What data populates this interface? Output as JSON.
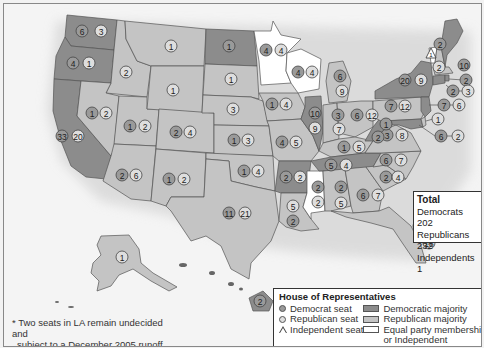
{
  "map": {
    "title": "House of Representatives by State",
    "colors": {
      "democratic_majority": "#8c8c8c",
      "republican_majority": "#c4c4c4",
      "equal_or_independent": "#ffffff",
      "democrat_seat": "#9a9a9a",
      "republican_seat": "#dedede",
      "background": "#f4f4f4"
    },
    "states": [
      {
        "state": "WA",
        "dem": 6,
        "rep": 3,
        "majority": "D"
      },
      {
        "state": "OR",
        "dem": 4,
        "rep": 1,
        "majority": "D"
      },
      {
        "state": "CA",
        "dem": 33,
        "rep": 20,
        "majority": "D"
      },
      {
        "state": "ID",
        "dem": null,
        "rep": 2,
        "majority": "R"
      },
      {
        "state": "NV",
        "dem": 1,
        "rep": 2,
        "majority": "R"
      },
      {
        "state": "UT",
        "dem": 1,
        "rep": 2,
        "majority": "R"
      },
      {
        "state": "AZ",
        "dem": 2,
        "rep": 6,
        "majority": "R"
      },
      {
        "state": "MT",
        "dem": null,
        "rep": 1,
        "majority": "R"
      },
      {
        "state": "WY",
        "dem": null,
        "rep": 1,
        "majority": "R"
      },
      {
        "state": "CO",
        "dem": 2,
        "rep": 4,
        "majority": "R"
      },
      {
        "state": "NM",
        "dem": 1,
        "rep": 2,
        "majority": "R"
      },
      {
        "state": "ND",
        "dem": 1,
        "rep": null,
        "majority": "D"
      },
      {
        "state": "SD",
        "dem": null,
        "rep": 1,
        "majority": "R"
      },
      {
        "state": "NE",
        "dem": null,
        "rep": 3,
        "majority": "R"
      },
      {
        "state": "KS",
        "dem": 1,
        "rep": 3,
        "majority": "R"
      },
      {
        "state": "OK",
        "dem": 1,
        "rep": 4,
        "majority": "R"
      },
      {
        "state": "TX",
        "dem": 11,
        "rep": 21,
        "majority": "R"
      },
      {
        "state": "MN",
        "dem": 4,
        "rep": 4,
        "majority": "E"
      },
      {
        "state": "IA",
        "dem": 1,
        "rep": 4,
        "majority": "R"
      },
      {
        "state": "MO",
        "dem": 4,
        "rep": 5,
        "majority": "R"
      },
      {
        "state": "AR",
        "dem": 2,
        "rep": 2,
        "majority": "D"
      },
      {
        "state": "LA",
        "dem": 2,
        "rep": 5,
        "majority": "R"
      },
      {
        "state": "WI",
        "dem": 4,
        "rep": 4,
        "majority": "E"
      },
      {
        "state": "IL",
        "dem": 10,
        "rep": 9,
        "majority": "D"
      },
      {
        "state": "MS",
        "dem": 2,
        "rep": 2,
        "majority": "E"
      },
      {
        "state": "MI",
        "dem": 6,
        "rep": 9,
        "majority": "R"
      },
      {
        "state": "IN",
        "dem": 3,
        "rep": 7,
        "majority": "R"
      },
      {
        "state": "OH",
        "dem": 6,
        "rep": 12,
        "majority": "R"
      },
      {
        "state": "KY",
        "dem": 1,
        "rep": 5,
        "majority": "R"
      },
      {
        "state": "TN",
        "dem": 5,
        "rep": 4,
        "majority": "D"
      },
      {
        "state": "AL",
        "dem": 2,
        "rep": 5,
        "majority": "R"
      },
      {
        "state": "GA",
        "dem": 6,
        "rep": 7,
        "majority": "R"
      },
      {
        "state": "FL",
        "dem": 7,
        "rep": 18,
        "majority": "R"
      },
      {
        "state": "SC",
        "dem": 2,
        "rep": 4,
        "majority": "R"
      },
      {
        "state": "NC",
        "dem": 6,
        "rep": 7,
        "majority": "R"
      },
      {
        "state": "VA",
        "dem": 3,
        "rep": 8,
        "majority": "R"
      },
      {
        "state": "WV",
        "dem": 2,
        "rep": 1,
        "majority": "D"
      },
      {
        "state": "PA",
        "dem": 7,
        "rep": 12,
        "majority": "R"
      },
      {
        "state": "NY",
        "dem": 20,
        "rep": 9,
        "majority": "D"
      },
      {
        "state": "VT",
        "dem": null,
        "rep": null,
        "ind": 1,
        "majority": "I"
      },
      {
        "state": "NH",
        "dem": null,
        "rep": 2,
        "majority": "R"
      },
      {
        "state": "ME",
        "dem": 2,
        "rep": null,
        "majority": "D"
      },
      {
        "state": "MA",
        "dem": 10,
        "rep": null,
        "majority": "D"
      },
      {
        "state": "RI",
        "dem": 2,
        "rep": null,
        "majority": "D"
      },
      {
        "state": "CT",
        "dem": 2,
        "rep": 3,
        "majority": "R"
      },
      {
        "state": "NJ",
        "dem": 7,
        "rep": 6,
        "majority": "D"
      },
      {
        "state": "DE",
        "dem": null,
        "rep": 1,
        "majority": "R"
      },
      {
        "state": "MD",
        "dem": 6,
        "rep": 2,
        "majority": "D"
      },
      {
        "state": "AK",
        "dem": null,
        "rep": 1,
        "majority": "R"
      },
      {
        "state": "HI",
        "dem": 2,
        "rep": null,
        "majority": "D"
      }
    ],
    "seat_labels": [
      {
        "x": 81,
        "y": 30,
        "v": "6",
        "p": "D"
      },
      {
        "x": 100,
        "y": 30,
        "v": "3",
        "p": "R"
      },
      {
        "x": 72,
        "y": 62,
        "v": "4",
        "p": "D"
      },
      {
        "x": 88,
        "y": 62,
        "v": "1",
        "p": "R"
      },
      {
        "x": 125,
        "y": 71,
        "v": "2",
        "p": "R"
      },
      {
        "x": 61,
        "y": 135,
        "v": "33",
        "p": "D"
      },
      {
        "x": 77,
        "y": 135,
        "v": "20",
        "p": "R"
      },
      {
        "x": 91,
        "y": 112,
        "v": "1",
        "p": "D"
      },
      {
        "x": 105,
        "y": 112,
        "v": "2",
        "p": "R"
      },
      {
        "x": 129,
        "y": 125,
        "v": "1",
        "p": "D"
      },
      {
        "x": 144,
        "y": 125,
        "v": "2",
        "p": "R"
      },
      {
        "x": 121,
        "y": 174,
        "v": "2",
        "p": "D"
      },
      {
        "x": 135,
        "y": 174,
        "v": "6",
        "p": "R"
      },
      {
        "x": 170,
        "y": 45,
        "v": "1",
        "p": "R"
      },
      {
        "x": 172,
        "y": 89,
        "v": "1",
        "p": "R"
      },
      {
        "x": 175,
        "y": 131,
        "v": "2",
        "p": "D"
      },
      {
        "x": 189,
        "y": 131,
        "v": "4",
        "p": "R"
      },
      {
        "x": 168,
        "y": 178,
        "v": "1",
        "p": "D"
      },
      {
        "x": 183,
        "y": 178,
        "v": "2",
        "p": "R"
      },
      {
        "x": 228,
        "y": 45,
        "v": "1",
        "p": "D"
      },
      {
        "x": 230,
        "y": 78,
        "v": "1",
        "p": "R"
      },
      {
        "x": 232,
        "y": 108,
        "v": "3",
        "p": "R"
      },
      {
        "x": 233,
        "y": 139,
        "v": "1",
        "p": "D"
      },
      {
        "x": 247,
        "y": 139,
        "v": "3",
        "p": "R"
      },
      {
        "x": 243,
        "y": 170,
        "v": "1",
        "p": "D"
      },
      {
        "x": 257,
        "y": 170,
        "v": "4",
        "p": "R"
      },
      {
        "x": 228,
        "y": 212,
        "v": "11",
        "p": "D"
      },
      {
        "x": 244,
        "y": 212,
        "v": "21",
        "p": "R"
      },
      {
        "x": 265,
        "y": 49,
        "v": "4",
        "p": "D"
      },
      {
        "x": 280,
        "y": 49,
        "v": "4",
        "p": "R"
      },
      {
        "x": 271,
        "y": 103,
        "v": "1",
        "p": "D"
      },
      {
        "x": 285,
        "y": 103,
        "v": "4",
        "p": "R"
      },
      {
        "x": 281,
        "y": 141,
        "v": "4",
        "p": "D"
      },
      {
        "x": 295,
        "y": 141,
        "v": "5",
        "p": "R"
      },
      {
        "x": 285,
        "y": 176,
        "v": "2",
        "p": "D"
      },
      {
        "x": 299,
        "y": 176,
        "v": "2",
        "p": "R"
      },
      {
        "x": 292,
        "y": 205,
        "v": "5",
        "p": "R"
      },
      {
        "x": 292,
        "y": 220,
        "v": "2",
        "p": "D"
      },
      {
        "x": 297,
        "y": 71,
        "v": "4",
        "p": "D"
      },
      {
        "x": 311,
        "y": 71,
        "v": "4",
        "p": "R"
      },
      {
        "x": 314,
        "y": 112,
        "v": "10",
        "p": "D"
      },
      {
        "x": 314,
        "y": 127,
        "v": "9",
        "p": "R"
      },
      {
        "x": 317,
        "y": 186,
        "v": "2",
        "p": "D"
      },
      {
        "x": 317,
        "y": 201,
        "v": "2",
        "p": "R"
      },
      {
        "x": 339,
        "y": 75,
        "v": "6",
        "p": "D"
      },
      {
        "x": 341,
        "y": 90,
        "v": "9",
        "p": "R"
      },
      {
        "x": 337,
        "y": 114,
        "v": "3",
        "p": "D"
      },
      {
        "x": 338,
        "y": 128,
        "v": "7",
        "p": "R"
      },
      {
        "x": 356,
        "y": 114,
        "v": "6",
        "p": "D"
      },
      {
        "x": 371,
        "y": 114,
        "v": "12",
        "p": "R"
      },
      {
        "x": 343,
        "y": 146,
        "v": "1",
        "p": "D"
      },
      {
        "x": 358,
        "y": 146,
        "v": "5",
        "p": "R"
      },
      {
        "x": 330,
        "y": 164,
        "v": "5",
        "p": "D"
      },
      {
        "x": 345,
        "y": 164,
        "v": "4",
        "p": "R"
      },
      {
        "x": 340,
        "y": 186,
        "v": "2",
        "p": "D"
      },
      {
        "x": 340,
        "y": 202,
        "v": "5",
        "p": "R"
      },
      {
        "x": 362,
        "y": 194,
        "v": "6",
        "p": "D"
      },
      {
        "x": 377,
        "y": 194,
        "v": "7",
        "p": "R"
      },
      {
        "x": 385,
        "y": 159,
        "v": "6",
        "p": "D"
      },
      {
        "x": 400,
        "y": 159,
        "v": "7",
        "p": "R"
      },
      {
        "x": 385,
        "y": 176,
        "v": "2",
        "p": "D"
      },
      {
        "x": 397,
        "y": 176,
        "v": "4",
        "p": "R"
      },
      {
        "x": 386,
        "y": 134,
        "v": "3",
        "p": "D"
      },
      {
        "x": 401,
        "y": 134,
        "v": "8",
        "p": "R"
      },
      {
        "x": 385,
        "y": 123,
        "v": "1",
        "p": "D"
      },
      {
        "x": 377,
        "y": 136,
        "v": "2",
        "p": "D"
      },
      {
        "x": 390,
        "y": 105,
        "v": "7",
        "p": "D"
      },
      {
        "x": 404,
        "y": 105,
        "v": "12",
        "p": "R"
      },
      {
        "x": 404,
        "y": 79,
        "v": "20",
        "p": "D"
      },
      {
        "x": 420,
        "y": 79,
        "v": "9",
        "p": "R"
      },
      {
        "x": 439,
        "y": 43,
        "v": "2",
        "p": "D"
      },
      {
        "x": 438,
        "y": 66,
        "v": "2",
        "p": "R"
      },
      {
        "x": 463,
        "y": 64,
        "v": "10",
        "p": "D"
      },
      {
        "x": 465,
        "y": 79,
        "v": "2",
        "p": "D"
      },
      {
        "x": 452,
        "y": 90,
        "v": "2",
        "p": "D"
      },
      {
        "x": 467,
        "y": 90,
        "v": "3",
        "p": "R"
      },
      {
        "x": 443,
        "y": 104,
        "v": "7",
        "p": "D"
      },
      {
        "x": 458,
        "y": 104,
        "v": "6",
        "p": "R"
      },
      {
        "x": 437,
        "y": 118,
        "v": "1",
        "p": "R"
      },
      {
        "x": 440,
        "y": 135,
        "v": "6",
        "p": "D"
      },
      {
        "x": 457,
        "y": 135,
        "v": "2",
        "p": "R"
      },
      {
        "x": 418,
        "y": 225,
        "v": "7",
        "p": "D"
      },
      {
        "x": 428,
        "y": 242,
        "v": "18",
        "p": "R"
      },
      {
        "x": 121,
        "y": 256,
        "v": "1",
        "p": "R"
      },
      {
        "x": 259,
        "y": 300,
        "v": "2",
        "p": "D"
      }
    ],
    "independent_marker": {
      "x": 430,
      "y": 53,
      "v": "1"
    }
  },
  "total": {
    "title": "Total",
    "lines": [
      "Democrats 202",
      "Republicans 232",
      "Independents 1"
    ]
  },
  "legend": {
    "title": "House of Representatives",
    "items_left": [
      "Democrat seat",
      "Republican seat",
      "Independent seat"
    ],
    "items_right": [
      "Democratic majority",
      "Republican majority",
      "Equal party membership,",
      "or Independent"
    ]
  },
  "footnote": {
    "lines": [
      "* Two seats in LA remain undecided and",
      "subject to a December 2005 runoff."
    ]
  }
}
